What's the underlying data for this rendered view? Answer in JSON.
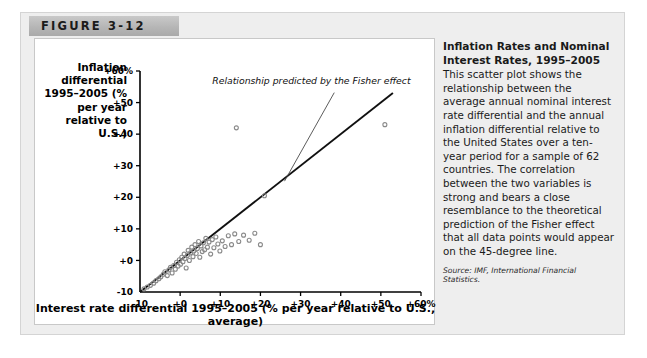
{
  "figure": {
    "banner_label": "FIGURE 3-12"
  },
  "caption": {
    "title": "Inflation Rates and Nominal Interest Rates, 1995–2005",
    "body": "This scatter plot shows the relationship between the average annual nominal interest rate differential and the annual inflation differential relative to the United States over a ten-year period for a sample of 62 countries. The correlation between the two variables is strong and bears a close resemblance to the theoretical prediction of the Fisher effect that all data points would appear on the 45-degree line.",
    "source": "Source: IMF, International Financial Statistics."
  },
  "chart_data": {
    "type": "scatter",
    "title": "Inflation Rates and Nominal Interest Rates, 1995–2005",
    "ylabel": "Inflation differential 1995–2005 (% per year relative to U.S.)",
    "xlabel": "Interest rate differential 1995–2005 (% per year relative to U.S., average)",
    "xlim": [
      -10,
      60
    ],
    "ylim": [
      -10,
      60
    ],
    "grid": false,
    "legend": null,
    "xticks": [
      "-10",
      "+0",
      "+10",
      "+20",
      "+30",
      "+40",
      "+50",
      "+60%"
    ],
    "xtick_values": [
      -10,
      0,
      10,
      20,
      30,
      40,
      50,
      60
    ],
    "yticks": [
      "-10",
      "+0",
      "+10",
      "+20",
      "+30",
      "+40",
      "+50",
      "+60%"
    ],
    "ytick_values": [
      -10,
      0,
      10,
      20,
      30,
      40,
      50,
      60
    ],
    "annotations": [
      {
        "text": "Relationship predicted by the Fisher effect",
        "x": 8,
        "y": 56,
        "leader_to_x": 27,
        "leader_to_y": 27
      }
    ],
    "reference_line": {
      "name": "45-degree line",
      "from": [
        -10,
        -10
      ],
      "to": [
        53,
        53
      ],
      "color": "#101010"
    },
    "marker": {
      "shape": "open-circle",
      "color": "#8a8a8a",
      "size": 4
    },
    "n_points": 62,
    "points": [
      [
        -9.0,
        -9.0
      ],
      [
        -8.2,
        -8.4
      ],
      [
        -7.4,
        -7.9
      ],
      [
        -6.6,
        -7.2
      ],
      [
        -6.0,
        -6.4
      ],
      [
        -5.3,
        -5.8
      ],
      [
        -4.8,
        -5.2
      ],
      [
        -4.2,
        -4.4
      ],
      [
        -3.8,
        -3.6
      ],
      [
        -3.2,
        -4.8
      ],
      [
        -2.8,
        -3.0
      ],
      [
        -2.4,
        -2.2
      ],
      [
        -2.0,
        -4.0
      ],
      [
        -1.6,
        -1.6
      ],
      [
        -1.2,
        -2.8
      ],
      [
        -0.9,
        -0.6
      ],
      [
        -0.5,
        -1.8
      ],
      [
        -0.2,
        0.2
      ],
      [
        0.1,
        -1.2
      ],
      [
        0.4,
        1.0
      ],
      [
        0.7,
        -0.4
      ],
      [
        1.0,
        2.0
      ],
      [
        1.2,
        0.6
      ],
      [
        1.5,
        -2.4
      ],
      [
        1.8,
        1.6
      ],
      [
        2.0,
        3.2
      ],
      [
        2.3,
        0.0
      ],
      [
        2.6,
        2.4
      ],
      [
        2.9,
        4.2
      ],
      [
        3.2,
        1.2
      ],
      [
        3.4,
        3.0
      ],
      [
        3.7,
        5.0
      ],
      [
        4.0,
        2.2
      ],
      [
        4.3,
        3.8
      ],
      [
        4.6,
        6.0
      ],
      [
        4.9,
        1.0
      ],
      [
        5.2,
        4.6
      ],
      [
        5.5,
        2.8
      ],
      [
        5.8,
        5.6
      ],
      [
        6.1,
        3.4
      ],
      [
        6.4,
        7.0
      ],
      [
        6.8,
        4.2
      ],
      [
        7.2,
        5.8
      ],
      [
        7.6,
        2.0
      ],
      [
        8.0,
        6.6
      ],
      [
        8.4,
        4.0
      ],
      [
        8.9,
        7.4
      ],
      [
        9.4,
        5.2
      ],
      [
        9.9,
        3.0
      ],
      [
        10.5,
        6.2
      ],
      [
        11.2,
        4.4
      ],
      [
        12.0,
        7.8
      ],
      [
        12.8,
        5.0
      ],
      [
        13.6,
        8.4
      ],
      [
        14.6,
        6.0
      ],
      [
        15.8,
        8.0
      ],
      [
        17.2,
        6.4
      ],
      [
        18.6,
        8.6
      ],
      [
        14.0,
        42.0
      ],
      [
        21.0,
        20.5
      ],
      [
        20.0,
        5.0
      ],
      [
        51.0,
        43.0
      ]
    ]
  }
}
